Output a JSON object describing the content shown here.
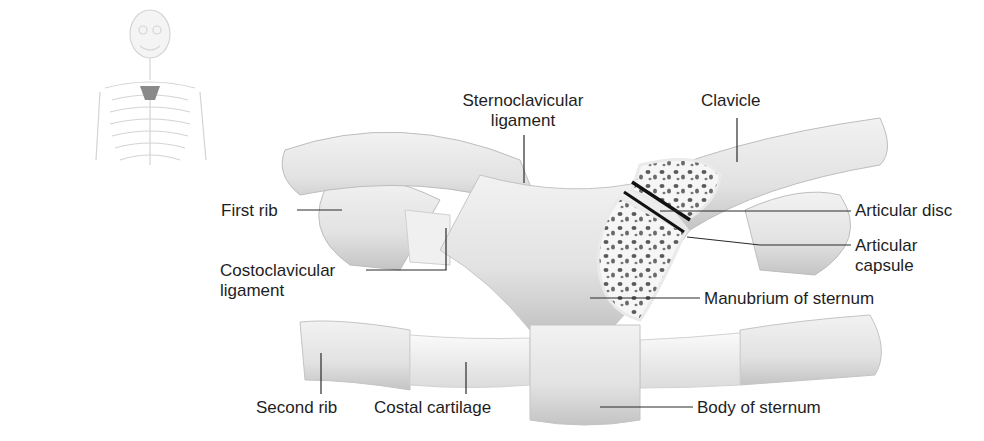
{
  "diagram": {
    "labels": {
      "sternoclavicular_ligament": [
        "Sternoclavicular",
        "ligament"
      ],
      "clavicle": "Clavicle",
      "first_rib": "First rib",
      "articular_disc": "Articular disc",
      "articular_capsule": [
        "Articular",
        "capsule"
      ],
      "costoclavicular_ligament": [
        "Costoclavicular",
        "ligament"
      ],
      "manubrium_of_sternum": "Manubrium of sternum",
      "second_rib": "Second rib",
      "costal_cartilage": "Costal cartilage",
      "body_of_sternum": "Body of sternum"
    },
    "colors": {
      "bone": "#e6e6e6",
      "bone_shade": "#c8c8c8",
      "cartilage": "#f0f0f0",
      "leader_line": "#2a2a2a",
      "spongy_bone": "#5a5a5a",
      "thumbnail": "#d8d8d8",
      "highlight": "#8a8a8a"
    }
  }
}
